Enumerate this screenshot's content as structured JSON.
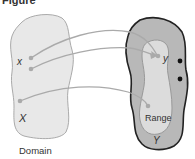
{
  "figure": {
    "title_fragment": "Figure",
    "domain_set_label": "X",
    "domain_element_label": "x",
    "domain_caption": "Domain",
    "codomain_set_label": "Y",
    "range_element_label": "y",
    "range_label": "Range"
  },
  "colors": {
    "domain_fill": "#e8e8e8",
    "domain_stroke": "#aaaaaa",
    "codomain_fill": "#b8b8b8",
    "codomain_stroke": "#222222",
    "range_fill": "#dcdcdc",
    "range_stroke": "#999999",
    "arrow": "#aaaaaa",
    "dot": "#111111"
  }
}
